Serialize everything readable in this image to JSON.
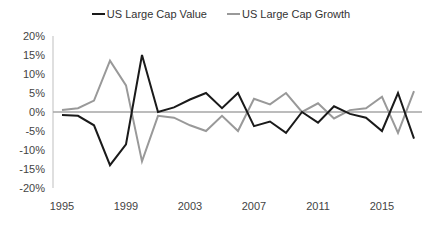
{
  "chart_data": {
    "type": "line",
    "title": "",
    "xlabel": "",
    "ylabel": "",
    "x": [
      1995,
      1996,
      1997,
      1998,
      1999,
      2000,
      2001,
      2002,
      2003,
      2004,
      2005,
      2006,
      2007,
      2008,
      2009,
      2010,
      2011,
      2012,
      2013,
      2014,
      2015,
      2016,
      2017
    ],
    "x_tick_labels": [
      "1995",
      "1999",
      "2003",
      "2007",
      "2011",
      "2015"
    ],
    "y_tick_labels": [
      "20%",
      "15%",
      "10%",
      "5%",
      "0%",
      "-5%",
      "-10%",
      "-15%",
      "-20%"
    ],
    "ylim": [
      -20,
      20
    ],
    "grid": false,
    "legend_position": "top",
    "series": [
      {
        "name": "US Large Cap Value",
        "color": "#1a1a1a",
        "values": [
          -0.8,
          -1,
          -3.5,
          -14,
          -8.5,
          15,
          0,
          1.2,
          3.3,
          5,
          1,
          5,
          -3.7,
          -2.5,
          -5.5,
          0,
          -2.8,
          1.5,
          -0.5,
          -1.5,
          -5,
          5,
          -7
        ]
      },
      {
        "name": "US Large Cap Growth",
        "color": "#999999",
        "values": [
          0.5,
          1,
          3,
          13.5,
          7,
          -13,
          -1,
          -1.5,
          -3.5,
          -5,
          -1,
          -5,
          3.5,
          2,
          5,
          0,
          2.3,
          -1.7,
          0.5,
          1,
          4,
          -5.5,
          5.5
        ]
      }
    ]
  },
  "legend": {
    "items": [
      {
        "label": "US Large Cap Value",
        "color": "#1a1a1a"
      },
      {
        "label": "US Large Cap Growth",
        "color": "#999999"
      }
    ]
  }
}
